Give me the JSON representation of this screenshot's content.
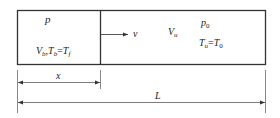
{
  "diagram": {
    "type": "piston-cylinder schematic",
    "burned_region": {
      "pressure_label": "p",
      "volume_label": "V",
      "volume_sub": "b",
      "temp_label_1": "T",
      "temp_sub_1": "b",
      "temp_eq": "=",
      "temp_label_2": "T",
      "temp_sub_2": "f",
      "separator": ","
    },
    "interface": {
      "velocity_label": "v"
    },
    "unburned_region": {
      "volume_label": "V",
      "volume_sub": "u",
      "pressure_label": "p",
      "pressure_sub": "0",
      "temp_label_1": "T",
      "temp_sub_1": "u",
      "temp_eq": "=",
      "temp_label_2": "T",
      "temp_sub_2": "0"
    },
    "dimensions": {
      "partial_label": "x",
      "total_label": "L"
    },
    "colors": {
      "line": "#333333",
      "text": "#222222",
      "background": "#ffffff"
    }
  }
}
